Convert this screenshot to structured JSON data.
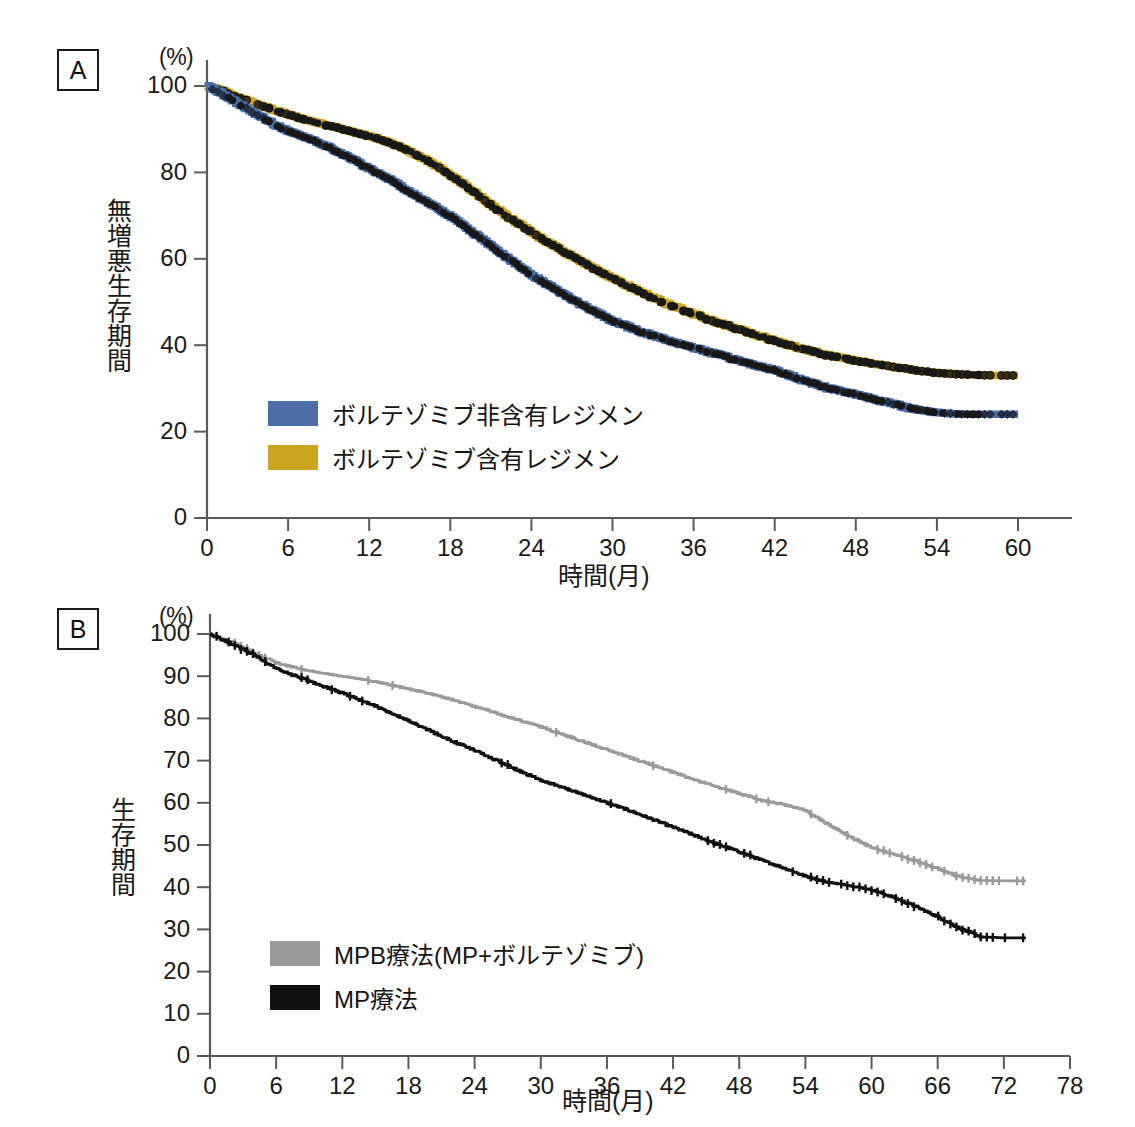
{
  "figure": {
    "panels": [
      {
        "tag": "A",
        "unit": "(%)",
        "ylabel": "無増悪生存期間",
        "xlabel": "時間(月)",
        "legend": [
          {
            "label": "ボルテゾミブ非含有レジメン",
            "color": "#4a6ea8",
            "name": "bortezomib-free-regimen"
          },
          {
            "label": "ボルテゾミブ含有レジメン",
            "color": "#c9a520",
            "name": "bortezomib-containing-regimen"
          }
        ]
      },
      {
        "tag": "B",
        "unit": "(%)",
        "ylabel": "生存期間",
        "xlabel": "時間(月)",
        "legend": [
          {
            "label": "MPB療法(MP+ボルテゾミブ)",
            "color": "#9a9a9a",
            "name": "mpb-therapy"
          },
          {
            "label": "MP療法",
            "color": "#101010",
            "name": "mp-therapy"
          }
        ]
      }
    ]
  },
  "chart_data": [
    {
      "type": "line",
      "panel": "A",
      "title": "無増悪生存期間",
      "xlabel": "時間(月)",
      "ylabel": "無増悪生存期間",
      "yunit": "(%)",
      "xlim": [
        0,
        62
      ],
      "ylim": [
        0,
        100
      ],
      "xticks": [
        0,
        6,
        12,
        18,
        24,
        30,
        36,
        42,
        48,
        54,
        60
      ],
      "yticks": [
        0,
        20,
        40,
        60,
        80,
        100
      ],
      "grid": false,
      "legend_position": "inside-lower-left",
      "series": [
        {
          "name": "ボルテゾミブ非含有レジメン",
          "color": "#4a6ea8",
          "marker": "diamond",
          "x": [
            0,
            1,
            2,
            3,
            4,
            5,
            6,
            7,
            8,
            9,
            10,
            11,
            12,
            13,
            14,
            15,
            16,
            17,
            18,
            19,
            20,
            21,
            22,
            23,
            24,
            25,
            26,
            27,
            28,
            30,
            32,
            34,
            36,
            38,
            40,
            42,
            44,
            46,
            48,
            50,
            52,
            54,
            56,
            58,
            60
          ],
          "y": [
            100,
            98.4,
            96.5,
            94.6,
            92.8,
            91.0,
            89.6,
            88.4,
            87.2,
            85.8,
            84.2,
            82.6,
            80.8,
            79.2,
            77.4,
            75.4,
            73.6,
            71.8,
            69.8,
            67.6,
            65.3,
            63.0,
            60.7,
            58.4,
            56.2,
            54.4,
            52.5,
            50.6,
            48.8,
            45.6,
            43.2,
            41.2,
            39.4,
            37.6,
            35.8,
            34.2,
            32.0,
            30.0,
            28.6,
            27.0,
            25.4,
            24.4,
            24.0,
            24.0,
            24.0
          ]
        },
        {
          "name": "ボルテゾミブ含有レジメン",
          "color": "#c9a520",
          "marker": "circle",
          "x": [
            0,
            1,
            2,
            3,
            4,
            5,
            6,
            7,
            8,
            9,
            10,
            11,
            12,
            13,
            14,
            15,
            16,
            17,
            18,
            19,
            20,
            21,
            22,
            23,
            24,
            25,
            26,
            27,
            28,
            30,
            32,
            34,
            36,
            38,
            40,
            42,
            44,
            46,
            48,
            50,
            52,
            54,
            56,
            58,
            60
          ],
          "y": [
            100,
            99.0,
            97.8,
            96.6,
            95.5,
            94.4,
            93.4,
            92.4,
            91.6,
            90.8,
            90.0,
            89.2,
            88.4,
            87.4,
            86.2,
            84.8,
            83.2,
            81.4,
            79.4,
            77.2,
            74.8,
            72.4,
            70.2,
            68.2,
            66.2,
            64.2,
            62.4,
            60.6,
            58.8,
            55.4,
            52.4,
            49.6,
            47.2,
            45.0,
            43.0,
            41.0,
            39.2,
            37.6,
            36.4,
            35.4,
            34.4,
            33.6,
            33.2,
            33.0,
            33.0
          ]
        }
      ]
    },
    {
      "type": "line",
      "panel": "B",
      "title": "生存期間",
      "xlabel": "時間(月)",
      "ylabel": "生存期間",
      "yunit": "(%)",
      "xlim": [
        0,
        78
      ],
      "ylim": [
        0,
        100
      ],
      "xticks": [
        0,
        6,
        12,
        18,
        24,
        30,
        36,
        42,
        48,
        54,
        60,
        66,
        72,
        78
      ],
      "yticks": [
        0,
        10,
        20,
        30,
        40,
        50,
        60,
        70,
        80,
        90,
        100
      ],
      "grid": false,
      "legend_position": "inside-lower-left",
      "series": [
        {
          "name": "MPB療法(MP+ボルテゾミブ)",
          "color": "#9a9a9a",
          "marker": "plus",
          "x": [
            0,
            2,
            4,
            6,
            8,
            10,
            12,
            14,
            16,
            18,
            20,
            22,
            24,
            26,
            28,
            30,
            32,
            34,
            36,
            38,
            40,
            42,
            44,
            46,
            48,
            50,
            52,
            54,
            56,
            58,
            60,
            62,
            64,
            66,
            68,
            70,
            72,
            74
          ],
          "y": [
            100,
            98.0,
            95.6,
            93.2,
            91.8,
            90.8,
            90.0,
            89.2,
            88.2,
            87.0,
            85.8,
            84.4,
            82.8,
            81.2,
            79.6,
            78.0,
            76.2,
            74.4,
            72.6,
            70.8,
            69.0,
            67.2,
            65.4,
            63.8,
            62.2,
            60.6,
            59.6,
            58.2,
            55.0,
            52.0,
            49.4,
            47.8,
            46.2,
            44.4,
            42.4,
            41.6,
            41.5,
            41.5
          ]
        },
        {
          "name": "MP療法",
          "color": "#101010",
          "marker": "plus",
          "x": [
            0,
            2,
            4,
            6,
            8,
            10,
            12,
            14,
            16,
            18,
            20,
            22,
            24,
            26,
            28,
            30,
            32,
            34,
            36,
            38,
            40,
            42,
            44,
            46,
            48,
            50,
            52,
            54,
            56,
            58,
            60,
            62,
            64,
            66,
            68,
            70,
            72,
            74
          ],
          "y": [
            100,
            97.6,
            95.0,
            91.8,
            89.8,
            87.8,
            86.0,
            84.0,
            81.8,
            79.4,
            77.0,
            74.6,
            72.4,
            70.0,
            67.6,
            65.4,
            63.6,
            61.8,
            60.0,
            58.2,
            56.2,
            54.2,
            52.2,
            50.2,
            48.4,
            46.4,
            44.6,
            42.6,
            41.2,
            40.4,
            39.4,
            37.6,
            35.4,
            33.0,
            30.2,
            28.2,
            28.0,
            28.0
          ]
        }
      ]
    }
  ]
}
